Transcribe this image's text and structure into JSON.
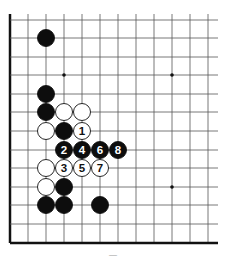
{
  "diagram": {
    "type": "go-board-corner",
    "grid": {
      "x_lines": [
        10,
        28,
        46,
        64,
        82,
        100,
        118,
        136,
        154,
        172,
        190,
        208
      ],
      "y_lines": [
        20,
        38,
        57,
        75,
        94,
        112,
        131,
        150,
        168,
        187,
        205,
        224,
        243
      ],
      "line_right": 218,
      "line_top": 14,
      "left_edge_x": 10,
      "bottom_edge_y": 243,
      "line_color": "#555555",
      "edge_color": "#111111"
    },
    "star_points": [
      [
        64,
        75
      ],
      [
        172,
        75
      ],
      [
        172,
        187
      ]
    ],
    "stone_radius": 8.5,
    "stones": [
      {
        "color": "black",
        "x": 46,
        "y": 38,
        "label": ""
      },
      {
        "color": "black",
        "x": 46,
        "y": 94,
        "label": ""
      },
      {
        "color": "black",
        "x": 46,
        "y": 112,
        "label": ""
      },
      {
        "color": "white",
        "x": 64,
        "y": 112,
        "label": ""
      },
      {
        "color": "white",
        "x": 82,
        "y": 112,
        "label": ""
      },
      {
        "color": "white",
        "x": 46,
        "y": 131,
        "label": ""
      },
      {
        "color": "black",
        "x": 64,
        "y": 131,
        "label": ""
      },
      {
        "color": "white",
        "x": 82,
        "y": 131,
        "label": "1"
      },
      {
        "color": "black",
        "x": 64,
        "y": 150,
        "label": "2"
      },
      {
        "color": "black",
        "x": 82,
        "y": 150,
        "label": "4"
      },
      {
        "color": "black",
        "x": 100,
        "y": 150,
        "label": "6"
      },
      {
        "color": "black",
        "x": 118,
        "y": 150,
        "label": "8"
      },
      {
        "color": "white",
        "x": 46,
        "y": 168,
        "label": ""
      },
      {
        "color": "white",
        "x": 64,
        "y": 168,
        "label": "3"
      },
      {
        "color": "white",
        "x": 82,
        "y": 168,
        "label": "5"
      },
      {
        "color": "white",
        "x": 100,
        "y": 168,
        "label": "7"
      },
      {
        "color": "white",
        "x": 46,
        "y": 187,
        "label": ""
      },
      {
        "color": "black",
        "x": 64,
        "y": 187,
        "label": ""
      },
      {
        "color": "black",
        "x": 46,
        "y": 205,
        "label": ""
      },
      {
        "color": "black",
        "x": 64,
        "y": 205,
        "label": ""
      },
      {
        "color": "black",
        "x": 100,
        "y": 205,
        "label": ""
      }
    ],
    "caption": "—"
  }
}
